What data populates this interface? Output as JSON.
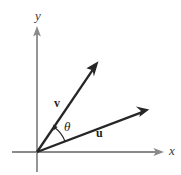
{
  "figure": {
    "width": 181,
    "height": 175,
    "background_color": "#ffffff"
  },
  "colors": {
    "axis": "#8a8a8a",
    "vector": "#262626",
    "arc": "#262626",
    "axis_label_text": "#3a3a3a",
    "vector_label_text": "#1e1e1e"
  },
  "axes": {
    "origin": {
      "x": 37,
      "y": 152
    },
    "x_axis": {
      "label": "x",
      "label_style": "italic",
      "start": {
        "x": 12,
        "y": 152
      },
      "end": {
        "x": 163,
        "y": 152
      },
      "label_position": {
        "x": 169,
        "y": 144
      },
      "arrowhead": true
    },
    "y_axis": {
      "label": "y",
      "label_style": "italic",
      "start": {
        "x": 37,
        "y": 172
      },
      "end": {
        "x": 37,
        "y": 27
      },
      "label_position": {
        "x": 35,
        "y": 9
      },
      "arrowhead": true
    }
  },
  "vectors": [
    {
      "name": "v",
      "label": "v",
      "label_style": "bold",
      "tail": {
        "x": 37,
        "y": 152
      },
      "tip": {
        "x": 98,
        "y": 62
      },
      "label_position": {
        "x": 54,
        "y": 97
      },
      "color": "#262626",
      "arrowhead": true
    },
    {
      "name": "u",
      "label": "u",
      "label_style": "bold",
      "tail": {
        "x": 37,
        "y": 152
      },
      "tip": {
        "x": 148,
        "y": 110
      },
      "label_position": {
        "x": 96,
        "y": 127
      },
      "color": "#262626",
      "arrowhead": true
    }
  ],
  "angle": {
    "label": "θ",
    "label_name": "theta",
    "label_style": "italic",
    "label_position": {
      "x": 64,
      "y": 120
    },
    "arc_radius": 30,
    "from_vector": "u",
    "to_vector": "v",
    "arc_arrowhead": true,
    "arc_arrowhead_at": "v"
  }
}
